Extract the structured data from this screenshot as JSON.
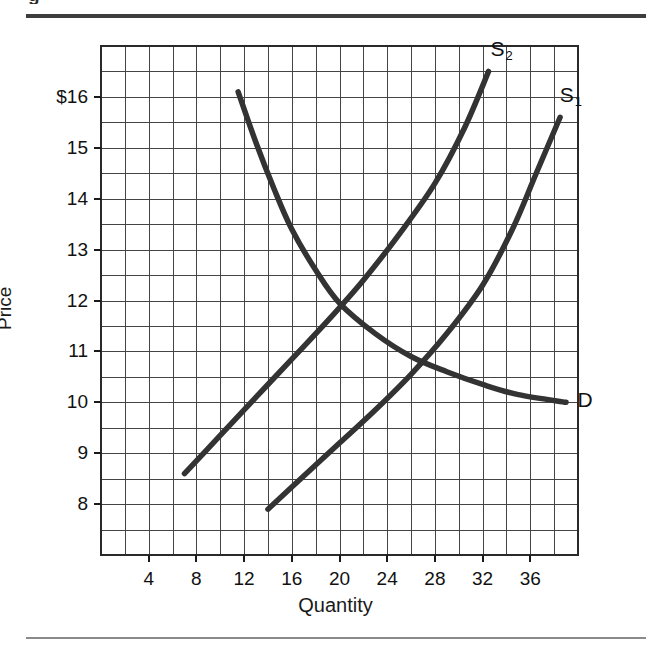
{
  "figure": {
    "clipped_caption": "g",
    "background_color": "#ffffff",
    "ink_color": "#333333",
    "grid_color": "#444444"
  },
  "chart_data": {
    "type": "line",
    "title": "",
    "xlabel": "Quantity",
    "ylabel": "Price",
    "xlim": [
      0,
      40
    ],
    "ylim": [
      7,
      17
    ],
    "grid": true,
    "grid_step_x": 2,
    "grid_step_y": 0.5,
    "legend_position": "inline-curve-labels",
    "xticks": [
      4,
      8,
      12,
      16,
      20,
      24,
      28,
      32,
      36
    ],
    "xticklabels": [
      "4",
      "8",
      "12",
      "16",
      "20",
      "24",
      "28",
      "32",
      "36"
    ],
    "yticks": [
      16,
      15,
      14,
      13,
      12,
      11,
      10,
      9,
      8
    ],
    "yticklabels": [
      "$16",
      "15",
      "14",
      "13",
      "12",
      "11",
      "10",
      "9",
      "8"
    ],
    "series": [
      {
        "name": "S2",
        "label": "S₂",
        "label_text": "S",
        "label_sub": "2",
        "role": "supply-shifted",
        "points": [
          [
            7,
            8.6
          ],
          [
            10,
            9.35
          ],
          [
            13,
            10.1
          ],
          [
            16,
            10.85
          ],
          [
            19,
            11.6
          ],
          [
            22,
            12.4
          ],
          [
            25,
            13.3
          ],
          [
            28,
            14.3
          ],
          [
            30.5,
            15.4
          ],
          [
            32.5,
            16.5
          ]
        ]
      },
      {
        "name": "S1",
        "label": "S₁",
        "label_text": "S",
        "label_sub": "1",
        "role": "supply-original",
        "points": [
          [
            14,
            7.9
          ],
          [
            17,
            8.55
          ],
          [
            20,
            9.2
          ],
          [
            23,
            9.85
          ],
          [
            26,
            10.55
          ],
          [
            29,
            11.35
          ],
          [
            32,
            12.3
          ],
          [
            34.5,
            13.4
          ],
          [
            36.5,
            14.5
          ],
          [
            38.5,
            15.6
          ]
        ]
      },
      {
        "name": "D",
        "label": "D",
        "label_text": "D",
        "label_sub": "",
        "role": "demand",
        "points": [
          [
            11.5,
            16.1
          ],
          [
            13,
            15.1
          ],
          [
            14.5,
            14.2
          ],
          [
            16,
            13.4
          ],
          [
            18,
            12.6
          ],
          [
            20,
            11.95
          ],
          [
            23,
            11.35
          ],
          [
            26,
            10.9
          ],
          [
            29,
            10.6
          ],
          [
            32,
            10.35
          ],
          [
            35,
            10.15
          ],
          [
            39,
            10.0
          ]
        ]
      }
    ],
    "intersections": [
      {
        "name": "equilibrium-s2-d",
        "x": 20,
        "y": 11.95
      },
      {
        "name": "equilibrium-s1-d",
        "x": 28,
        "y": 10.7
      }
    ],
    "annotations": [
      {
        "name": "label-s2",
        "text": "S₂",
        "x": 32.5,
        "y": 16.9
      },
      {
        "name": "label-s1",
        "text": "S₁",
        "x": 38.3,
        "y": 16.0
      },
      {
        "name": "label-d",
        "text": "D",
        "x": 39.8,
        "y": 10.0
      }
    ]
  }
}
